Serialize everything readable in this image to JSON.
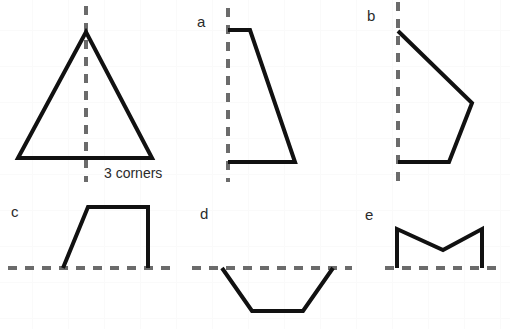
{
  "page": {
    "width": 510,
    "height": 329,
    "background_color": "#ffffff",
    "grid_color": "#fafafa",
    "grid_spacing": 36
  },
  "style": {
    "shape_stroke_color": "#111111",
    "shape_stroke_width": 4,
    "mirror_line_color": "#6b6b6b",
    "mirror_line_width": 4,
    "mirror_dash": "9 8"
  },
  "annotations": {
    "corners_note": "3 corners"
  },
  "figures": [
    {
      "id": "triangle",
      "label": "",
      "mirror_line": {
        "orientation": "vertical",
        "x1": 86,
        "y1": 6,
        "x2": 86,
        "y2": 182
      },
      "polyline": [
        [
          18,
          158
        ],
        [
          86,
          32
        ],
        [
          152,
          158
        ],
        [
          18,
          158
        ]
      ],
      "closed": true
    },
    {
      "id": "a",
      "label": "a",
      "label_pos": [
        197,
        14
      ],
      "mirror_line": {
        "orientation": "vertical",
        "x1": 228,
        "y1": 8,
        "x2": 228,
        "y2": 182
      },
      "polyline": [
        [
          228,
          30
        ],
        [
          250,
          30
        ],
        [
          295,
          162
        ],
        [
          228,
          162
        ]
      ],
      "closed": false
    },
    {
      "id": "b",
      "label": "b",
      "label_pos": [
        367,
        8
      ],
      "mirror_line": {
        "orientation": "vertical",
        "x1": 398,
        "y1": 2,
        "x2": 398,
        "y2": 182
      },
      "polyline": [
        [
          398,
          31
        ],
        [
          472,
          103
        ],
        [
          449,
          162
        ],
        [
          398,
          162
        ]
      ],
      "closed": false
    },
    {
      "id": "c",
      "label": "c",
      "label_pos": [
        11,
        204
      ],
      "mirror_line": {
        "orientation": "horizontal",
        "x1": 8,
        "y1": 268,
        "x2": 178,
        "y2": 268
      },
      "polyline": [
        [
          63,
          268
        ],
        [
          88,
          207
        ],
        [
          148,
          207
        ],
        [
          148,
          268
        ]
      ],
      "closed": false
    },
    {
      "id": "d",
      "label": "d",
      "label_pos": [
        200,
        206
      ],
      "mirror_line": {
        "orientation": "horizontal",
        "x1": 192,
        "y1": 268,
        "x2": 352,
        "y2": 268
      },
      "polyline": [
        [
          222,
          268
        ],
        [
          252,
          311
        ],
        [
          303,
          311
        ],
        [
          333,
          268
        ]
      ],
      "closed": false
    },
    {
      "id": "e",
      "label": "e",
      "label_pos": [
        365,
        207
      ],
      "mirror_line": {
        "orientation": "horizontal",
        "x1": 385,
        "y1": 268,
        "x2": 503,
        "y2": 268
      },
      "polyline": [
        [
          397,
          268
        ],
        [
          397,
          229
        ],
        [
          443,
          250
        ],
        [
          482,
          229
        ],
        [
          482,
          268
        ]
      ],
      "closed": false
    }
  ]
}
